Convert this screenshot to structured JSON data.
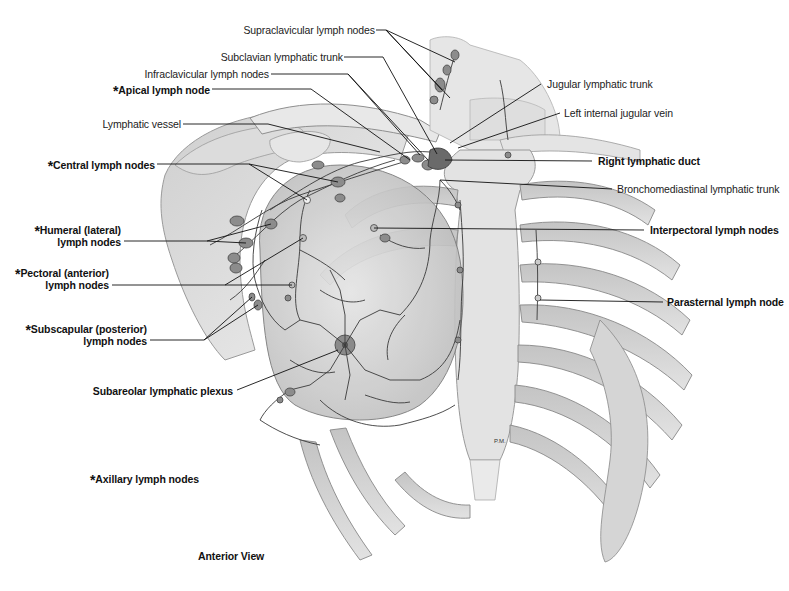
{
  "figure": {
    "view_caption": "Anterior View",
    "legend_note": {
      "marker": "*",
      "text": "Axillary lymph nodes"
    },
    "artist_initials": "P.M."
  },
  "labels": {
    "supraclavicular": {
      "text": "Supraclavicular lymph nodes",
      "bold": false,
      "starred": false
    },
    "subclavian_trunk": {
      "text": "Subclavian lymphatic trunk",
      "bold": false,
      "starred": false
    },
    "infraclavicular": {
      "text": "Infraclavicular lymph nodes",
      "bold": false,
      "starred": false
    },
    "apical": {
      "text": "Apical lymph node",
      "bold": true,
      "starred": true
    },
    "lymphatic_vessel": {
      "text": "Lymphatic vessel",
      "bold": false,
      "starred": false
    },
    "central": {
      "text": "Central lymph nodes",
      "bold": true,
      "starred": true
    },
    "humeral_line1": {
      "text": "Humeral (lateral)",
      "bold": true,
      "starred": true
    },
    "humeral_line2": {
      "text": "lymph nodes"
    },
    "pectoral_line1": {
      "text": "Pectoral (anterior)",
      "bold": true,
      "starred": true
    },
    "pectoral_line2": {
      "text": "lymph nodes"
    },
    "subscapular_line1": {
      "text": "Subscapular (posterior)",
      "bold": true,
      "starred": true
    },
    "subscapular_line2": {
      "text": "lymph nodes"
    },
    "subareolar": {
      "text": "Subareolar lymphatic plexus",
      "bold": true,
      "starred": false
    },
    "jugular_trunk": {
      "text": "Jugular lymphatic trunk",
      "bold": false,
      "starred": false
    },
    "left_ijv": {
      "text": "Left internal jugular vein",
      "bold": false,
      "starred": false
    },
    "right_duct": {
      "text": "Right lymphatic duct",
      "bold": true,
      "starred": false
    },
    "bronchomediastinal": {
      "text": "Bronchomediastinal lymphatic trunk",
      "bold": false,
      "starred": false
    },
    "interpectoral": {
      "text": "Interpectoral lymph nodes",
      "bold": true,
      "starred": false
    },
    "parasternal": {
      "text": "Parasternal lymph node",
      "bold": true,
      "starred": false
    }
  },
  "colors": {
    "bone": "#d9d9d9",
    "bone_dark": "#a8a8a8",
    "outline": "#6e6e6e",
    "vessel": "#3a3a3a",
    "node": "#8c8c8c",
    "leader": "#111111"
  }
}
